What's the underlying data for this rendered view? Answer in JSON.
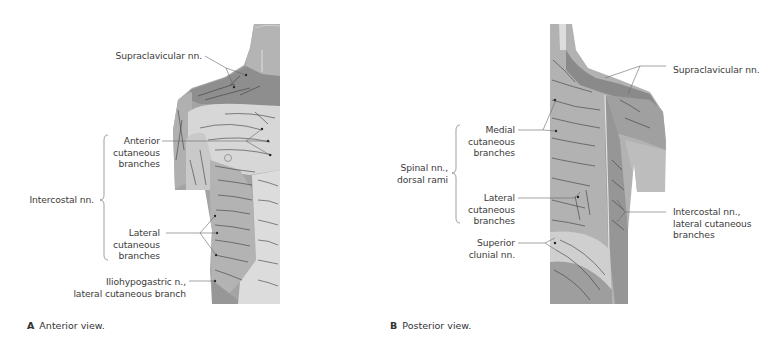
{
  "figure_a": {
    "caption_letter": "A",
    "caption_text": "Anterior view.",
    "labels": {
      "supraclavicular": "Supraclavicular nn.",
      "anterior_1": "Anterior",
      "anterior_2": "cutaneous",
      "anterior_3": "branches",
      "intercostal": "Intercostal nn.",
      "lateral_1": "Lateral",
      "lateral_2": "cutaneous",
      "lateral_3": "branches",
      "iliohypogastric_1": "Iliohypogastric n.,",
      "iliohypogastric_2": "lateral cutaneous branch"
    }
  },
  "figure_b": {
    "caption_letter": "B",
    "caption_text": "Posterior view.",
    "labels": {
      "supraclavicular": "Supraclavicular nn.",
      "medial_1": "Medial",
      "medial_2": "cutaneous",
      "medial_3": "branches",
      "spinal_1": "Spinal nn.,",
      "spinal_2": "dorsal rami",
      "lateral_1": "Lateral",
      "lateral_2": "cutaneous",
      "lateral_3": "branches",
      "clunial_1": "Superior",
      "clunial_2": "clunial nn.",
      "intercostal_1": "Intercostal nn.,",
      "intercostal_2": "lateral cutaneous",
      "intercostal_3": "branches"
    }
  },
  "colors": {
    "dark_zone": "#8f8f8f",
    "mid_zone": "#a9a9a9",
    "light_zone": "#cfcfcf",
    "pale_zone": "#dedede",
    "nerve": "#3a3a3a",
    "leader": "#5a5a5a"
  }
}
